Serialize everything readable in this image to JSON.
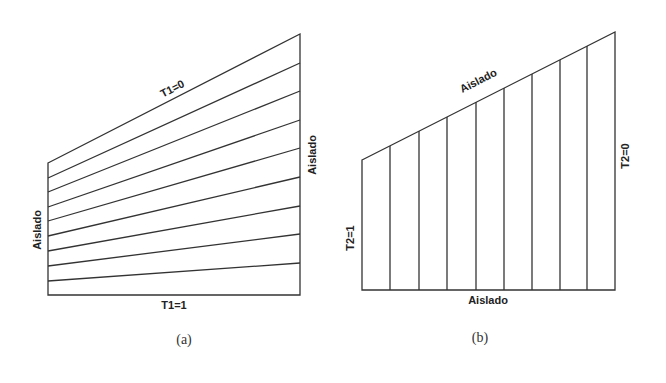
{
  "figure_a": {
    "caption": "(a)",
    "top_label": "T1=0",
    "bottom_label": "T1=1",
    "left_label": "Aislado",
    "right_label": "Aislado",
    "shape": {
      "left_x": 48,
      "right_x": 300,
      "top_left_y": 163,
      "top_right_y": 34,
      "bottom_y": 295
    },
    "line_count": 9
  },
  "figure_b": {
    "caption": "(b)",
    "top_label": "Aislado",
    "bottom_label": "Aislado",
    "left_label": "T2=1",
    "right_label": "T2=0",
    "shape": {
      "left_x": 362,
      "right_x": 615,
      "top_left_y": 160,
      "top_right_y": 32,
      "bottom_y": 290
    },
    "line_count": 8
  },
  "ghost_text": {
    "line1": "T                    T                    m                                    ",
    "line2": "                                                         "
  }
}
